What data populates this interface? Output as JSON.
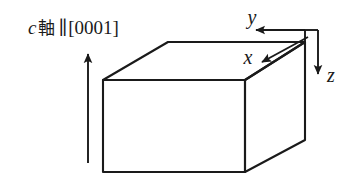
{
  "figure": {
    "kind": "crystal-orientation-schematic",
    "width": 352,
    "height": 189,
    "background_color": "#ffffff",
    "line_color": "#1a1a1a"
  },
  "caption": {
    "c_axis_symbol": "c",
    "axis_kanji": "軸",
    "parallel_symbol": "∥",
    "miller_index": "[0001]",
    "full_text": "c 軸 ∥ [0001]"
  },
  "axes": [
    {
      "id": "c-axis",
      "label": "",
      "direction": "up",
      "description": "vertical arrow indicating the crystal c axis"
    },
    {
      "id": "x-axis",
      "label": "x",
      "direction": "down-left",
      "description": "arrow along the upper right edge of the block"
    },
    {
      "id": "y-axis",
      "label": "y",
      "direction": "left",
      "description": "horizontal arrow pointing left above the block"
    },
    {
      "id": "z-axis",
      "label": "z",
      "direction": "down",
      "description": "vertical arrow pointing downward at the right"
    }
  ],
  "labels": {
    "x": "x",
    "y": "y",
    "z": "z"
  },
  "block": {
    "shape": "rectangular-slab",
    "description": "isometric rectangular block representing the crystal specimen"
  }
}
